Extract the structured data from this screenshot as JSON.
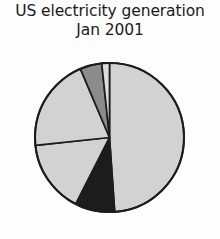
{
  "chart_data": {
    "type": "pie",
    "title": "US electricity generation\nJan 2001",
    "title_line1": "US electricity generation",
    "title_line2": "Jan 2001",
    "xlabel": "",
    "ylabel": "",
    "legend": "none",
    "grid": false,
    "start_angle_deg": 0,
    "direction": "clockwise",
    "categories": [
      "Coal",
      "Hydro",
      "Natural gas",
      "Nuclear",
      "Other renewables",
      "Petroleum"
    ],
    "values": [
      48.9,
      8.6,
      15.8,
      20.3,
      4.7,
      1.7
    ],
    "colors": [
      "#d2d2d2",
      "#1c1c1c",
      "#d2d2d2",
      "#d2d2d2",
      "#8b8b8b",
      "#dcdcdc"
    ],
    "slices": [
      {
        "label": "Coal",
        "value": 48.9,
        "color": "#d2d2d2",
        "start_deg": 0,
        "end_deg": 176
      },
      {
        "label": "Hydro",
        "value": 8.6,
        "color": "#1c1c1c",
        "start_deg": 176,
        "end_deg": 207
      },
      {
        "label": "Natural gas",
        "value": 15.8,
        "color": "#d2d2d2",
        "start_deg": 207,
        "end_deg": 264
      },
      {
        "label": "Nuclear",
        "value": 20.3,
        "color": "#d2d2d2",
        "start_deg": 264,
        "end_deg": 337
      },
      {
        "label": "Other renewables",
        "value": 4.7,
        "color": "#8b8b8b",
        "start_deg": 337,
        "end_deg": 354
      },
      {
        "label": "Petroleum",
        "value": 1.7,
        "color": "#dcdcdc",
        "start_deg": 354,
        "end_deg": 360
      }
    ],
    "geometry": {
      "cx": 109.5,
      "cy": 137.5,
      "r": 74.5
    }
  }
}
